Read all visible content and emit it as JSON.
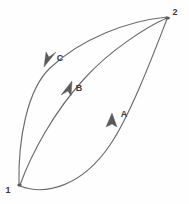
{
  "diagram": {
    "background_color": "#fefefe",
    "line_color": "#6b6b6b",
    "label_color": "#3a3a3a",
    "width": 189,
    "height": 204,
    "nodes": [
      {
        "id": "node-1",
        "label": "1",
        "x": 19,
        "y": 185,
        "label_x": 8,
        "label_y": 193
      },
      {
        "id": "node-2",
        "label": "2",
        "x": 168,
        "y": 18,
        "label_x": 174,
        "label_y": 14
      }
    ],
    "paths": [
      {
        "id": "path-a",
        "label": "A",
        "from": "1",
        "to": "2",
        "direction": "1-to-2",
        "label_x": 124,
        "label_y": 117,
        "arrow_x": 112,
        "arrow_y": 119,
        "arrow_angle": -62
      },
      {
        "id": "path-b",
        "label": "B",
        "from": "1",
        "to": "2",
        "direction": "1-to-2",
        "label_x": 79,
        "label_y": 91,
        "arrow_x": 68,
        "arrow_y": 89,
        "arrow_angle": -49
      },
      {
        "id": "path-c",
        "label": "C",
        "from": "2",
        "to": "1",
        "direction": "2-to-1",
        "label_x": 60,
        "label_y": 61,
        "arrow_x": 48,
        "arrow_y": 61,
        "arrow_angle": 128
      }
    ]
  }
}
